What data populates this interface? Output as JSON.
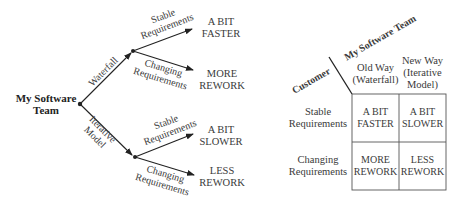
{
  "tree": {
    "root": {
      "line1": "My Software",
      "line2": "Team"
    },
    "branches": [
      {
        "label": "Waterfall",
        "children": [
          {
            "edge_line1": "Stable",
            "edge_line2": "Requirements",
            "outcome_line1": "A BIT",
            "outcome_line2": "FASTER"
          },
          {
            "edge_line1": "Changing",
            "edge_line2": "Requirements",
            "outcome_line1": "MORE",
            "outcome_line2": "REWORK"
          }
        ]
      },
      {
        "label_line1": "Iterative",
        "label_line2": "Model",
        "children": [
          {
            "edge_line1": "Stable",
            "edge_line2": "Requirements",
            "outcome_line1": "A BIT",
            "outcome_line2": "SLOWER"
          },
          {
            "edge_line1": "Changing",
            "edge_line2": "Requirements",
            "outcome_line1": "LESS",
            "outcome_line2": "REWORK"
          }
        ]
      }
    ]
  },
  "matrix": {
    "corner_top": "My Software Team",
    "corner_left": "Customer",
    "columns": [
      {
        "line1": "Old Way",
        "line2": "(Waterfall)"
      },
      {
        "line1": "New Way",
        "line2": "(Iterative",
        "line3": "Model)"
      }
    ],
    "rows": [
      {
        "line1": "Stable",
        "line2": "Requirements",
        "cells": [
          {
            "line1": "A BIT",
            "line2": "FASTER"
          },
          {
            "line1": "A BIT",
            "line2": "SLOWER"
          }
        ]
      },
      {
        "line1": "Changing",
        "line2": "Requirements",
        "cells": [
          {
            "line1": "MORE",
            "line2": "REWORK"
          },
          {
            "line1": "LESS",
            "line2": "REWORK"
          }
        ]
      }
    ]
  },
  "colors": {
    "line": "#222222",
    "text": "#3a3a3a"
  }
}
